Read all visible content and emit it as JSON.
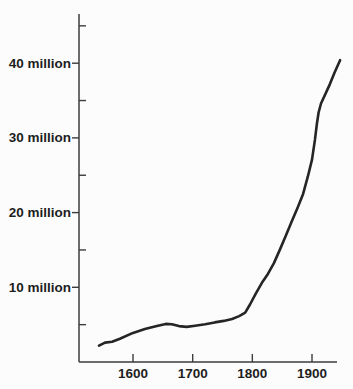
{
  "chart_data": {
    "type": "line",
    "grid": false,
    "legend": "none",
    "x_axis": {
      "range": [
        1510,
        1947
      ],
      "ticks": [
        {
          "value": 1600,
          "label": "1600"
        },
        {
          "value": 1700,
          "label": "1700"
        },
        {
          "value": 1800,
          "label": "1800"
        },
        {
          "value": 1900,
          "label": "1900"
        }
      ]
    },
    "y_axis": {
      "unit": "million",
      "range": [
        0,
        46.5
      ],
      "labeled_ticks": [
        {
          "value": 10,
          "label": "10 million"
        },
        {
          "value": 20,
          "label": "20 million"
        },
        {
          "value": 30,
          "label": "30 million"
        },
        {
          "value": 40,
          "label": "40 million"
        }
      ],
      "minor_ticks": [
        5,
        15,
        25,
        35,
        45
      ]
    },
    "series": [
      {
        "name": "population",
        "color": "#252525",
        "points": [
          [
            1543,
            2.2
          ],
          [
            1553,
            2.6
          ],
          [
            1565,
            2.7
          ],
          [
            1578,
            3.1
          ],
          [
            1600,
            3.9
          ],
          [
            1620,
            4.4
          ],
          [
            1640,
            4.8
          ],
          [
            1655,
            5.1
          ],
          [
            1665,
            5.05
          ],
          [
            1677,
            4.8
          ],
          [
            1690,
            4.7
          ],
          [
            1704,
            4.85
          ],
          [
            1721,
            5.05
          ],
          [
            1737,
            5.3
          ],
          [
            1752,
            5.5
          ],
          [
            1766,
            5.75
          ],
          [
            1778,
            6.15
          ],
          [
            1788,
            6.6
          ],
          [
            1796,
            7.7
          ],
          [
            1806,
            9.2
          ],
          [
            1816,
            10.6
          ],
          [
            1826,
            11.8
          ],
          [
            1836,
            13.2
          ],
          [
            1846,
            15.0
          ],
          [
            1856,
            16.9
          ],
          [
            1866,
            18.8
          ],
          [
            1876,
            20.7
          ],
          [
            1885,
            22.5
          ],
          [
            1893,
            24.8
          ],
          [
            1900,
            27.1
          ],
          [
            1905,
            29.8
          ],
          [
            1908,
            31.8
          ],
          [
            1911,
            33.4
          ],
          [
            1915,
            34.6
          ],
          [
            1922,
            35.8
          ],
          [
            1930,
            37.2
          ],
          [
            1938,
            38.8
          ],
          [
            1947,
            40.4
          ]
        ]
      }
    ],
    "colors": {
      "background": "#fcfcfc",
      "axis": "#3c3c3c",
      "text": "#1e1e1e",
      "line": "#252525"
    }
  }
}
